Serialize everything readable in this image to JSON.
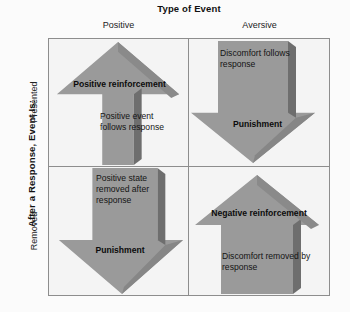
{
  "figure": {
    "name": "reinforcement-punishment-matrix",
    "colors": {
      "arrow_fill": "#9a9a9a",
      "arrow_shadow": "#6e6e6e",
      "grid_line": "#8d8d8d",
      "quadrant_background": "#f4f4f4",
      "page_background": "#fbfbfb",
      "text": "#111111"
    }
  },
  "column_axis": {
    "title": "Type of Event",
    "labels": [
      "Positive",
      "Aversive"
    ]
  },
  "row_axis": {
    "title": "After a Response, Event Is:",
    "labels": [
      "Presented",
      "Removed"
    ]
  },
  "quadrants": [
    {
      "id": "positive-presented",
      "heading": "Positive reinforcement",
      "description": "Positive event follows response",
      "arrow_direction": "up"
    },
    {
      "id": "aversive-presented",
      "heading": "Punishment",
      "description": "Discomfort follows response",
      "arrow_direction": "down"
    },
    {
      "id": "positive-removed",
      "heading": "Punishment",
      "description": "Positive state removed after response",
      "arrow_direction": "down"
    },
    {
      "id": "aversive-removed",
      "heading": "Negative reinforcement",
      "description": "Discomfort removed by response",
      "arrow_direction": "up"
    }
  ]
}
